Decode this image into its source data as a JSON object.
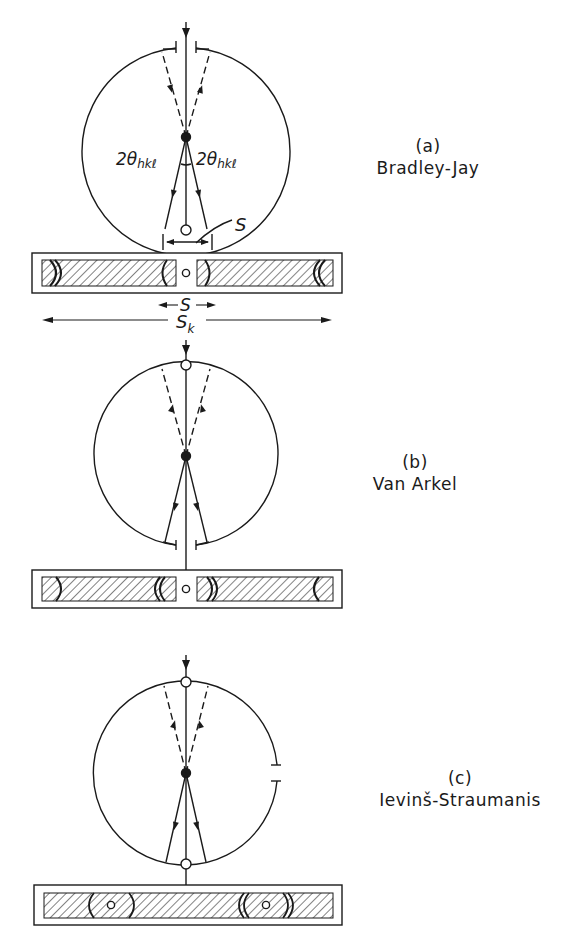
{
  "figure": {
    "panels": [
      {
        "tag": "(a)",
        "name": "Bradley-Jay",
        "angle_label_left": "2θhkℓ",
        "angle_label_right": "2θhkℓ",
        "arc_label": "S",
        "film_labels": {
          "s": "S",
          "sk": "Sk"
        }
      },
      {
        "tag": "(b)",
        "name": "Van Arkel"
      },
      {
        "tag": "(c)",
        "name": "Ievinš-Straumanis"
      }
    ]
  },
  "colors": {
    "ink": "#1a1a1a",
    "background": "#ffffff"
  }
}
